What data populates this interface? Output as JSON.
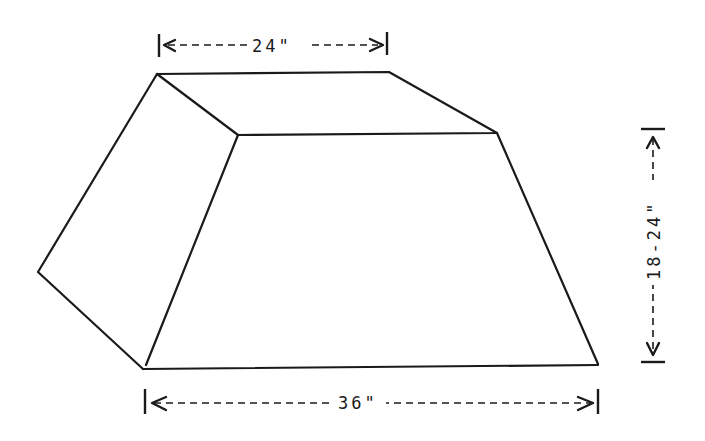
{
  "diagram": {
    "shape": "truncated pyramid (frustum) in perspective",
    "colors": {
      "line": "#1a1a1a",
      "background": "#ffffff"
    },
    "dimensions": {
      "top_width": "24\"",
      "bottom_width": "36\"",
      "height": "18-24\""
    }
  }
}
